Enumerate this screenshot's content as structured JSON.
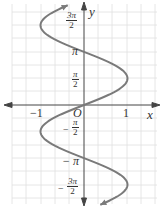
{
  "chart_data": {
    "type": "line",
    "title": "",
    "equation": "x = sin y",
    "xlabel": "x",
    "ylabel": "y",
    "xlim": [
      -1.6,
      1.7
    ],
    "ylim": [
      -6.4,
      6.2
    ],
    "grid": true,
    "x_ticks": [
      {
        "value": -1,
        "label": "-1"
      },
      {
        "value": 0,
        "label": "O"
      },
      {
        "value": 1,
        "label": "1"
      }
    ],
    "y_ticks": [
      {
        "value": 4.712,
        "label": "3π/2"
      },
      {
        "value": 3.1416,
        "label": "π"
      },
      {
        "value": 1.5708,
        "label": "π/2"
      },
      {
        "value": -1.5708,
        "label": "-π/2"
      },
      {
        "value": -3.1416,
        "label": "-π"
      },
      {
        "value": -4.712,
        "label": "-3π/2"
      }
    ],
    "series": [
      {
        "name": "x = sin y",
        "color": "#7a7a7a",
        "y_range": [
          -5.9,
          5.9
        ],
        "arrows": "both"
      }
    ]
  },
  "labels": {
    "x_axis": "x",
    "y_axis": "y",
    "origin": "O",
    "x_neg1": "−1",
    "x_pos1": "1",
    "pi": "π",
    "neg_pi": "− π",
    "frac_num_3pi": "3π",
    "frac_num_pi": "π",
    "frac_den_2": "2",
    "minus": "−"
  },
  "colors": {
    "grid": "#dcdcdc",
    "axis": "#444444",
    "curve": "#808080"
  }
}
